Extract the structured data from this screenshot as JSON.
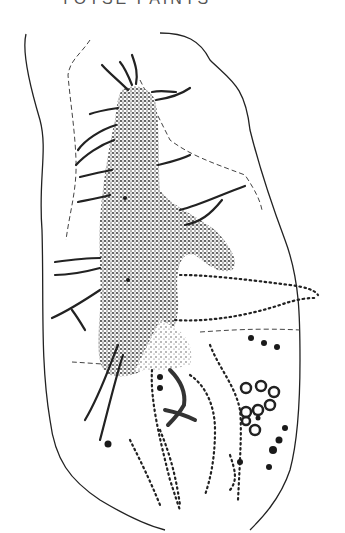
{
  "caption": {
    "text": "YOTSE PAINTS",
    "clipped": true
  },
  "figure": {
    "colors": {
      "ink": "#1a1a1a",
      "background": "#ffffff"
    }
  }
}
